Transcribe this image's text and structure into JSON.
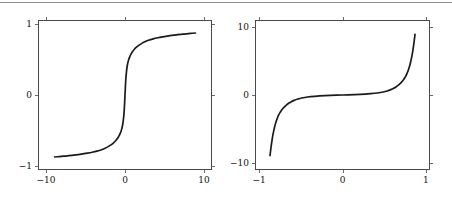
{
  "figure": {
    "background_color": "#ffffff",
    "rule_color": "#8d8d8d",
    "axis_color": "#4a4a4a",
    "curve_color": "#1a1a1a",
    "tick_color": "#6a6a6a"
  },
  "chart_data": [
    {
      "type": "line",
      "panel": "left",
      "title": "",
      "xlabel": "",
      "ylabel": "",
      "xlim": [
        -11,
        11
      ],
      "ylim": [
        -1.05,
        1.05
      ],
      "grid": false,
      "legend": "none",
      "xticks": [
        -10,
        0,
        10
      ],
      "xticklabels": [
        "−10",
        "0",
        "10"
      ],
      "yticks": [
        -1,
        0,
        1
      ],
      "yticklabels": [
        "−1",
        "0",
        "1"
      ],
      "series": [
        {
          "name": "sigmoid",
          "x": [
            -9.0,
            -8.4,
            -7.8,
            -7.2,
            -6.6,
            -6.0,
            -5.4,
            -4.8,
            -4.2,
            -3.6,
            -3.0,
            -2.6,
            -2.2,
            -1.8,
            -1.5,
            -1.2,
            -1.0,
            -0.8,
            -0.6,
            -0.45,
            -0.3,
            -0.2,
            -0.1,
            0.0,
            0.1,
            0.2,
            0.3,
            0.45,
            0.6,
            0.8,
            1.0,
            1.2,
            1.5,
            1.8,
            2.2,
            2.6,
            3.0,
            3.6,
            4.2,
            4.8,
            5.4,
            6.0,
            6.6,
            7.2,
            7.8,
            8.4,
            9.0
          ],
          "y": [
            -0.88,
            -0.874,
            -0.868,
            -0.861,
            -0.854,
            -0.846,
            -0.836,
            -0.825,
            -0.812,
            -0.796,
            -0.776,
            -0.758,
            -0.736,
            -0.708,
            -0.682,
            -0.649,
            -0.621,
            -0.587,
            -0.542,
            -0.495,
            -0.422,
            -0.343,
            -0.216,
            0.0,
            0.216,
            0.343,
            0.422,
            0.495,
            0.542,
            0.587,
            0.621,
            0.649,
            0.682,
            0.708,
            0.736,
            0.758,
            0.776,
            0.796,
            0.812,
            0.825,
            0.836,
            0.846,
            0.854,
            0.861,
            0.868,
            0.874,
            0.88
          ]
        }
      ]
    },
    {
      "type": "line",
      "panel": "right",
      "title": "",
      "xlabel": "",
      "ylabel": "",
      "xlim": [
        -1.05,
        1.05
      ],
      "ylim": [
        -11,
        11
      ],
      "grid": false,
      "legend": "none",
      "xticks": [
        -1,
        0,
        1
      ],
      "xticklabels": [
        "−1",
        "0",
        "1"
      ],
      "yticks": [
        -10,
        0,
        10
      ],
      "yticklabels": [
        "−10",
        "0",
        "10"
      ],
      "series": [
        {
          "name": "inverse-sigmoid",
          "x": [
            -0.88,
            -0.874,
            -0.868,
            -0.861,
            -0.854,
            -0.846,
            -0.836,
            -0.825,
            -0.812,
            -0.796,
            -0.776,
            -0.758,
            -0.736,
            -0.708,
            -0.682,
            -0.649,
            -0.621,
            -0.587,
            -0.542,
            -0.495,
            -0.422,
            -0.343,
            -0.216,
            0.0,
            0.216,
            0.343,
            0.422,
            0.495,
            0.542,
            0.587,
            0.621,
            0.649,
            0.682,
            0.708,
            0.736,
            0.758,
            0.776,
            0.796,
            0.812,
            0.825,
            0.836,
            0.846,
            0.854,
            0.861,
            0.868,
            0.874,
            0.88
          ],
          "y": [
            -9.0,
            -8.4,
            -7.8,
            -7.2,
            -6.6,
            -6.0,
            -5.4,
            -4.8,
            -4.2,
            -3.6,
            -3.0,
            -2.6,
            -2.2,
            -1.8,
            -1.5,
            -1.2,
            -1.0,
            -0.8,
            -0.6,
            -0.45,
            -0.3,
            -0.2,
            -0.1,
            0.0,
            0.1,
            0.2,
            0.3,
            0.45,
            0.6,
            0.8,
            1.0,
            1.2,
            1.5,
            1.8,
            2.2,
            2.6,
            3.0,
            3.6,
            4.2,
            4.8,
            5.4,
            6.0,
            6.6,
            7.2,
            7.8,
            8.4,
            9.0
          ]
        }
      ]
    }
  ]
}
